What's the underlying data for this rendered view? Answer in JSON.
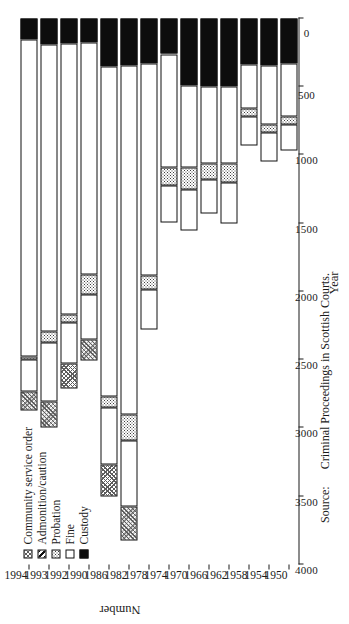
{
  "chart_data": {
    "type": "bar",
    "orientation": "horizontal-rotated",
    "stacked": true,
    "title": "",
    "xlabel": "Year",
    "ylabel": "Number",
    "ylim": [
      0,
      4000
    ],
    "tick_labels": [
      "0",
      "500",
      "1000",
      "1500",
      "2000",
      "2500",
      "3000",
      "3500",
      "4000"
    ],
    "tick_values": [
      0,
      500,
      1000,
      1500,
      2000,
      2500,
      3000,
      3500,
      4000
    ],
    "grid": false,
    "legend_position": "top-left",
    "categories": [
      "1950",
      "1954",
      "1958",
      "1962",
      "1966",
      "1970",
      "1974",
      "1978",
      "1982",
      "1986",
      "1990",
      "1992",
      "1993",
      "1994"
    ],
    "series": [
      {
        "name": "Custody",
        "key": "custody",
        "fill": "solid-black",
        "values": [
          330,
          345,
          340,
          500,
          500,
          490,
          260,
          330,
          345,
          350,
          175,
          180,
          190,
          155
        ]
      },
      {
        "name": "Fine",
        "key": "fine",
        "fill": "white",
        "values": [
          390,
          430,
          320,
          560,
          560,
          600,
          830,
          1555,
          2555,
          2420,
          1700,
          1990,
          2100,
          2320
        ]
      },
      {
        "name": "Probation",
        "key": "probation",
        "fill": "light-dotted",
        "values": [
          60,
          60,
          55,
          140,
          120,
          160,
          130,
          100,
          195,
          80,
          145,
          55,
          85,
          25
        ]
      },
      {
        "name": "Admonition/caution",
        "key": "admonition",
        "fill": "diagonal-hatch",
        "values": [
          185,
          215,
          215,
          300,
          250,
          300,
          275,
          290,
          480,
          420,
          330,
          305,
          430,
          230
        ]
      },
      {
        "name": "Community service order",
        "key": "cso",
        "fill": "cross-hatch",
        "values": [
          0,
          0,
          0,
          0,
          0,
          0,
          0,
          0,
          250,
          230,
          155,
          180,
          195,
          145
        ]
      }
    ],
    "totals": [
      965,
      1050,
      930,
      1500,
      1430,
      1550,
      1495,
      2275,
      3825,
      3500,
      2505,
      2710,
      3000,
      2875
    ]
  },
  "axes": {
    "value_axis_title": "Number",
    "category_axis_title": "Year"
  },
  "legend": {
    "items": [
      {
        "label": "Community service order",
        "swatch": "cross-hatch"
      },
      {
        "label": "Admonition/caution",
        "swatch": "diagonal-hatch"
      },
      {
        "label": "Probation",
        "swatch": "light-dotted"
      },
      {
        "label": "Fine",
        "swatch": "white"
      },
      {
        "label": "Custody",
        "swatch": "solid-black"
      }
    ]
  },
  "footer": {
    "source_label": "Source:",
    "source_text": "Criminal Proceedings in Scottish Courts."
  },
  "colors": {
    "ink": "#1a1a1a",
    "custody": "#0d0d0d",
    "fine": "#ffffff",
    "background": "#ffffff"
  }
}
